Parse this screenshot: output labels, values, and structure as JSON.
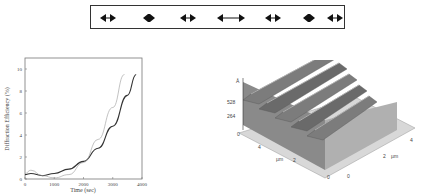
{
  "figure_top": {
    "description": "Row of double-headed arrow glyphs in a bordered box",
    "arrows": [
      {
        "type": "double-arrow-short"
      },
      {
        "type": "diamond"
      },
      {
        "type": "double-arrow-short"
      },
      {
        "type": "double-arrow-long"
      },
      {
        "type": "double-arrow-short"
      },
      {
        "type": "diamond"
      },
      {
        "type": "double-arrow-short"
      }
    ]
  },
  "chart_data": [
    {
      "type": "line",
      "title": "",
      "xlabel": "Time (sec)",
      "ylabel": "Diffraction Efficiency (%)",
      "xlim": [
        0,
        4000
      ],
      "ylim": [
        0,
        11
      ],
      "xticks": [
        "0",
        "1000",
        "2000",
        "3000",
        "4000"
      ],
      "yticks": [
        "0",
        "2",
        "4",
        "6",
        "8",
        "10"
      ],
      "grid": false,
      "series": [
        {
          "name": "solid",
          "style": "solid",
          "x": [
            0,
            200,
            600,
            1000,
            1500,
            2000,
            2500,
            3000,
            3500,
            3800
          ],
          "y": [
            0.4,
            0.5,
            0.3,
            0.5,
            0.9,
            1.6,
            2.8,
            4.8,
            7.6,
            9.5
          ]
        },
        {
          "name": "thin",
          "style": "thin",
          "x": [
            0,
            200,
            600,
            1000,
            1500,
            2000,
            2500,
            3000,
            3400
          ],
          "y": [
            0.5,
            0.8,
            0.3,
            0.1,
            0.4,
            1.5,
            3.6,
            6.5,
            9.5
          ]
        }
      ]
    },
    {
      "type": "surface3d",
      "title": "",
      "zlabel": "Å",
      "zticks": [
        "0",
        "264",
        "528"
      ],
      "xlabel": "µm",
      "ylabel": "µm",
      "xticks": [
        "0",
        "2",
        "4"
      ],
      "yticks": [
        "0",
        "2",
        "4"
      ],
      "description": "AFM surface relief grating with ~5 periodic ridges"
    }
  ]
}
